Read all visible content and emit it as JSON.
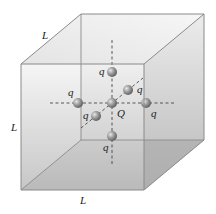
{
  "diagram": {
    "type": "cube-with-charges",
    "edge_labels": {
      "top": "L",
      "left": "L",
      "bottom": "L"
    },
    "center_charge": {
      "label": "Q"
    },
    "surrounding_charges": [
      {
        "position": "top",
        "label": "q"
      },
      {
        "position": "bottom",
        "label": "q"
      },
      {
        "position": "left",
        "label": "q"
      },
      {
        "position": "right",
        "label": "q"
      },
      {
        "position": "back",
        "label": "q"
      },
      {
        "position": "front",
        "label": "q"
      }
    ],
    "colors": {
      "cube_fill": "#c8c8c8",
      "cube_edge": "#8a8a8a",
      "charge": "#8c8c8c",
      "axis_dash": "#333333"
    }
  }
}
